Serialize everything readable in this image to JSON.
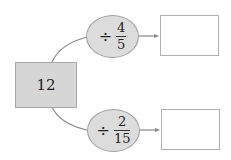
{
  "start": {
    "value": "12"
  },
  "operations": [
    {
      "sign": "÷",
      "numerator": "4",
      "denominator": "5",
      "answer": ""
    },
    {
      "sign": "÷",
      "numerator": "2",
      "denominator": "15",
      "answer": ""
    }
  ],
  "colors": {
    "box_fill": "#d6d6d6",
    "ellipse_fill": "#dcdcdc",
    "line": "#777777",
    "answer_border": "#b0b0b0"
  }
}
